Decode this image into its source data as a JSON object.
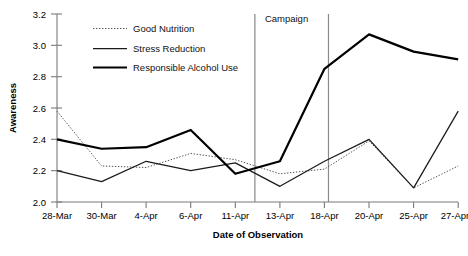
{
  "chart_data": {
    "type": "line",
    "title": "",
    "xlabel": "Date of Observation",
    "ylabel": "Awareness",
    "categories": [
      "28-Mar",
      "30-Mar",
      "4-Apr",
      "6-Apr",
      "11-Apr",
      "13-Apr",
      "18-Apr",
      "20-Apr",
      "25-Apr",
      "27-Apr"
    ],
    "ylim": [
      2.0,
      3.2
    ],
    "yticks": [
      "2.0",
      "2.2",
      "2.4",
      "2.6",
      "2.8",
      "3.0",
      "3.2"
    ],
    "ytick_values": [
      2.0,
      2.2,
      2.4,
      2.6,
      2.8,
      3.0,
      3.2
    ],
    "grid": false,
    "legend_position": "top-left-inside",
    "series": [
      {
        "name": "Good Nutrition",
        "style": "dotted",
        "values": [
          2.58,
          2.23,
          2.22,
          2.31,
          2.27,
          2.18,
          2.21,
          2.39,
          2.09,
          2.23
        ]
      },
      {
        "name": "Stress Reduction",
        "style": "thin-solid",
        "values": [
          2.2,
          2.13,
          2.26,
          2.2,
          2.25,
          2.1,
          2.26,
          2.4,
          2.09,
          2.58
        ]
      },
      {
        "name": "Responsible Alcohol Use",
        "style": "thick-solid",
        "values": [
          2.4,
          2.34,
          2.35,
          2.46,
          2.18,
          2.26,
          2.85,
          3.07,
          2.96,
          2.91
        ]
      }
    ],
    "annotations": [
      {
        "label": "Campaign",
        "type": "span-between-vertical-lines",
        "start_category": "13-Apr",
        "end_category": "18-Apr"
      }
    ]
  }
}
